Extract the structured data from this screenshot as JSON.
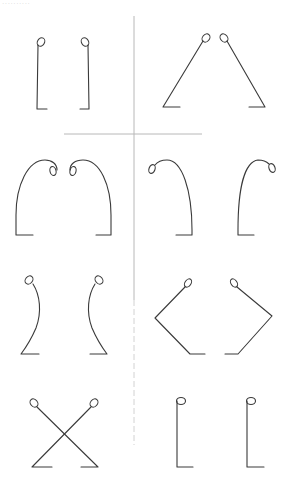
{
  "header": {
    "text": "··········"
  },
  "diagram": {
    "colors": {
      "stroke": "#3a3a3a",
      "divider": "#b8b8b8",
      "background": "#ffffff"
    },
    "panels": [
      {
        "id": 1,
        "shape": "straight vertical pair",
        "position": "row-1-left"
      },
      {
        "id": 2,
        "shape": "inverted V pair",
        "position": "row-1-right"
      },
      {
        "id": 3,
        "shape": "facing arches",
        "position": "row-2-left"
      },
      {
        "id": 4,
        "shape": "outward arches",
        "position": "row-2-right"
      },
      {
        "id": 5,
        "shape": "S-curve pair",
        "position": "row-3-left"
      },
      {
        "id": 6,
        "shape": "bent angle pair",
        "position": "row-3-right"
      },
      {
        "id": 7,
        "shape": "crossed X pair",
        "position": "row-4-left"
      },
      {
        "id": 8,
        "shape": "L pair",
        "position": "row-4-right"
      }
    ]
  }
}
